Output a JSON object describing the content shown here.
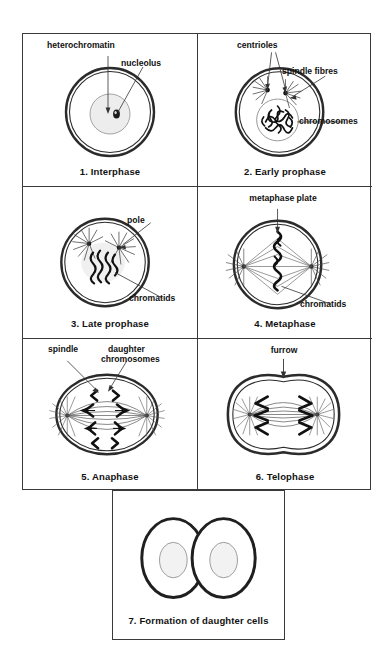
{
  "figure": {
    "panel_count": 7,
    "line_color": "#3a3a3a",
    "ink_color": "#111111",
    "nucleus_fill": "#efefef",
    "background": "#ffffff"
  },
  "panels": [
    {
      "number": "1",
      "caption": "1.  Interphase",
      "labels": [
        {
          "text": "heterochromatin",
          "name": "label-heterochromatin"
        },
        {
          "text": "nucleolus",
          "name": "label-nucleolus"
        }
      ]
    },
    {
      "number": "2",
      "caption": "2.  Early prophase",
      "labels": [
        {
          "text": "centrioles",
          "name": "label-centrioles"
        },
        {
          "text": "spindle fibres",
          "name": "label-spindle-fibres"
        },
        {
          "text": "chromosomes",
          "name": "label-chromosomes"
        }
      ]
    },
    {
      "number": "3",
      "caption": "3.  Late prophase",
      "labels": [
        {
          "text": "pole",
          "name": "label-pole"
        },
        {
          "text": "chromatids",
          "name": "label-chromatids"
        }
      ]
    },
    {
      "number": "4",
      "caption": "4.  Metaphase",
      "labels": [
        {
          "text": "metaphase plate",
          "name": "label-metaphase-plate"
        },
        {
          "text": "chromatids",
          "name": "label-chromatids"
        }
      ]
    },
    {
      "number": "5",
      "caption": "5.  Anaphase",
      "labels": [
        {
          "text": "spindle",
          "name": "label-spindle"
        },
        {
          "text": "daughter",
          "name": "label-daughter"
        },
        {
          "text": "chromosomes",
          "name": "label-chromosomes"
        }
      ]
    },
    {
      "number": "6",
      "caption": "6.  Telophase",
      "labels": [
        {
          "text": "furrow",
          "name": "label-furrow"
        }
      ]
    },
    {
      "number": "7",
      "caption": "7.  Formation of daughter cells",
      "labels": []
    }
  ]
}
